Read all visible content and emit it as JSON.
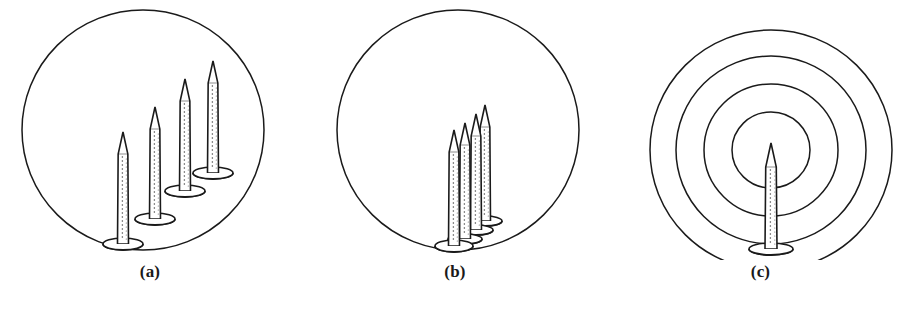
{
  "figure": {
    "type": "line-art-diagram",
    "background_color": "#ffffff",
    "stroke_color": "#1a1a1a",
    "fill_color": "#ffffff",
    "stipple_color": "#4a4a4a",
    "width": 911,
    "height": 313,
    "panel_count": 3
  },
  "panels": [
    {
      "id": "a",
      "caption": "(a)",
      "boundary": {
        "shape": "circle",
        "cx": 143,
        "cy": 130,
        "rx": 121,
        "ry": 120,
        "count": 1
      },
      "arrangement": "dispersed-diagonal",
      "nail_count": 4,
      "nails": [
        {
          "index": 1,
          "base_x": 123,
          "base_y": 244,
          "height": 112,
          "shaft_width": 11,
          "base_rx": 20,
          "base_ry": 6
        },
        {
          "index": 2,
          "base_x": 155,
          "base_y": 219,
          "height": 112,
          "shaft_width": 11,
          "base_rx": 20,
          "base_ry": 6
        },
        {
          "index": 3,
          "base_x": 185,
          "base_y": 191,
          "height": 112,
          "shaft_width": 11,
          "base_rx": 20,
          "base_ry": 6
        },
        {
          "index": 4,
          "base_x": 213,
          "base_y": 173,
          "height": 112,
          "shaft_width": 11,
          "base_rx": 20,
          "base_ry": 6
        }
      ]
    },
    {
      "id": "b",
      "caption": "(b)",
      "boundary": {
        "shape": "circle",
        "cx": 153,
        "cy": 130,
        "rx": 121,
        "ry": 120,
        "count": 1
      },
      "arrangement": "clustered-center",
      "nail_count": 4,
      "nails": [
        {
          "index": 1,
          "base_x": 180,
          "base_y": 221,
          "height": 116,
          "shaft_width": 11,
          "base_rx": 17,
          "base_ry": 5
        },
        {
          "index": 2,
          "base_x": 171,
          "base_y": 230,
          "height": 116,
          "shaft_width": 11,
          "base_rx": 17,
          "base_ry": 5
        },
        {
          "index": 3,
          "base_x": 160,
          "base_y": 239,
          "height": 116,
          "shaft_width": 11,
          "base_rx": 17,
          "base_ry": 5
        },
        {
          "index": 4,
          "base_x": 149,
          "base_y": 246,
          "height": 116,
          "shaft_width": 11,
          "base_rx": 19,
          "base_ry": 6
        }
      ]
    },
    {
      "id": "c",
      "caption": "(c)",
      "boundary": {
        "shape": "concentric-circles",
        "cx": 161,
        "cy": 150,
        "count": 4,
        "radii": [
          {
            "rx": 121,
            "ry": 120
          },
          {
            "rx": 95,
            "ry": 94
          },
          {
            "rx": 67,
            "ry": 66
          },
          {
            "rx": 39,
            "ry": 38
          }
        ]
      },
      "arrangement": "single-centered",
      "nail_count": 1,
      "nails": [
        {
          "index": 1,
          "base_x": 161,
          "base_y": 249,
          "height": 106,
          "shaft_width": 12,
          "base_rx": 22,
          "base_ry": 6
        }
      ]
    }
  ]
}
